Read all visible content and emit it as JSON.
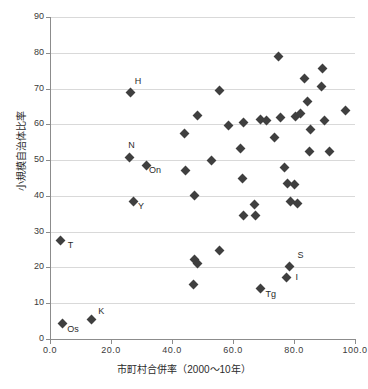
{
  "chart_data": {
    "type": "scatter",
    "title": "",
    "xlabel": "市町村合併率（2000〜10年）",
    "ylabel": "小規模自治体比率",
    "xlim": [
      0,
      100
    ],
    "ylim": [
      0,
      90
    ],
    "xticks": [
      "0.0",
      "20.0",
      "40.0",
      "60.0",
      "80.0",
      "100.0"
    ],
    "xtick_values": [
      0,
      20,
      40,
      60,
      80,
      100
    ],
    "yticks": [
      "0",
      "10",
      "20",
      "30",
      "40",
      "50",
      "60",
      "70",
      "80",
      "90"
    ],
    "ytick_values": [
      0,
      10,
      20,
      30,
      40,
      50,
      60,
      70,
      80,
      90
    ],
    "grid": "horizontal",
    "legend": "none",
    "marker": "diamond",
    "marker_color": "#3f3f3f",
    "grid_color": "#d9d9d9",
    "axis_color": "#8c8c8c",
    "points": [
      {
        "x": 4.0,
        "y": 4.3,
        "label": "Os",
        "label_dx": 5,
        "label_dy": 5
      },
      {
        "x": 13.5,
        "y": 5.4,
        "label": "K",
        "label_dx": 7,
        "label_dy": -9
      },
      {
        "x": 3.5,
        "y": 27.4,
        "label": "T",
        "label_dx": 7,
        "label_dy": 4
      },
      {
        "x": 26.5,
        "y": 69.0,
        "label": "H",
        "label_dx": 4,
        "label_dy": -11
      },
      {
        "x": 26.0,
        "y": 50.8,
        "label": "N",
        "label_dx": -1,
        "label_dy": -12
      },
      {
        "x": 31.5,
        "y": 48.6,
        "label": "On",
        "label_dx": 3,
        "label_dy": 5
      },
      {
        "x": 27.5,
        "y": 38.5,
        "label": "Y",
        "label_dx": 4,
        "label_dy": 5
      },
      {
        "x": 78.5,
        "y": 20.4,
        "label": "S",
        "label_dx": 8,
        "label_dy": -11
      },
      {
        "x": 77.5,
        "y": 17.3,
        "label": "I",
        "label_dx": 9,
        "label_dy": 0
      },
      {
        "x": 69.0,
        "y": 14.0,
        "label": "Tg",
        "label_dx": 5,
        "label_dy": 5
      },
      {
        "x": 47.0,
        "y": 15.2,
        "label": "",
        "label_dx": 0,
        "label_dy": 0
      },
      {
        "x": 47.5,
        "y": 22.3,
        "label": "",
        "label_dx": 0,
        "label_dy": 0
      },
      {
        "x": 48.5,
        "y": 21.2,
        "label": "",
        "label_dx": 0,
        "label_dy": 0
      },
      {
        "x": 55.5,
        "y": 24.6,
        "label": "",
        "label_dx": 0,
        "label_dy": 0
      },
      {
        "x": 47.5,
        "y": 40.2,
        "label": "",
        "label_dx": 0,
        "label_dy": 0
      },
      {
        "x": 44.5,
        "y": 47.0,
        "label": "",
        "label_dx": 0,
        "label_dy": 0
      },
      {
        "x": 44.0,
        "y": 57.3,
        "label": "",
        "label_dx": 0,
        "label_dy": 0
      },
      {
        "x": 48.5,
        "y": 62.6,
        "label": "",
        "label_dx": 0,
        "label_dy": 0
      },
      {
        "x": 55.5,
        "y": 69.5,
        "label": "",
        "label_dx": 0,
        "label_dy": 0
      },
      {
        "x": 53.0,
        "y": 50.0,
        "label": "",
        "label_dx": 0,
        "label_dy": 0
      },
      {
        "x": 58.5,
        "y": 59.7,
        "label": "",
        "label_dx": 0,
        "label_dy": 0
      },
      {
        "x": 63.5,
        "y": 60.4,
        "label": "",
        "label_dx": 0,
        "label_dy": 0
      },
      {
        "x": 62.5,
        "y": 53.3,
        "label": "",
        "label_dx": 0,
        "label_dy": 0
      },
      {
        "x": 63.0,
        "y": 44.8,
        "label": "",
        "label_dx": 0,
        "label_dy": 0
      },
      {
        "x": 67.0,
        "y": 37.6,
        "label": "",
        "label_dx": 0,
        "label_dy": 0
      },
      {
        "x": 63.5,
        "y": 34.4,
        "label": "",
        "label_dx": 0,
        "label_dy": 0
      },
      {
        "x": 67.5,
        "y": 34.4,
        "label": "",
        "label_dx": 0,
        "label_dy": 0
      },
      {
        "x": 69.0,
        "y": 61.3,
        "label": "",
        "label_dx": 0,
        "label_dy": 0
      },
      {
        "x": 71.0,
        "y": 61.2,
        "label": "",
        "label_dx": 0,
        "label_dy": 0
      },
      {
        "x": 73.5,
        "y": 56.4,
        "label": "",
        "label_dx": 0,
        "label_dy": 0
      },
      {
        "x": 75.0,
        "y": 79.0,
        "label": "",
        "label_dx": 0,
        "label_dy": 0
      },
      {
        "x": 75.5,
        "y": 61.8,
        "label": "",
        "label_dx": 0,
        "label_dy": 0
      },
      {
        "x": 77.0,
        "y": 47.8,
        "label": "",
        "label_dx": 0,
        "label_dy": 0
      },
      {
        "x": 78.0,
        "y": 43.5,
        "label": "",
        "label_dx": 0,
        "label_dy": 0
      },
      {
        "x": 80.0,
        "y": 43.3,
        "label": "",
        "label_dx": 0,
        "label_dy": 0
      },
      {
        "x": 79.0,
        "y": 38.5,
        "label": "",
        "label_dx": 0,
        "label_dy": 0
      },
      {
        "x": 81.0,
        "y": 38.0,
        "label": "",
        "label_dx": 0,
        "label_dy": 0
      },
      {
        "x": 80.5,
        "y": 62.2,
        "label": "",
        "label_dx": 0,
        "label_dy": 0
      },
      {
        "x": 82.0,
        "y": 63.0,
        "label": "",
        "label_dx": 0,
        "label_dy": 0
      },
      {
        "x": 83.5,
        "y": 72.8,
        "label": "",
        "label_dx": 0,
        "label_dy": 0
      },
      {
        "x": 84.5,
        "y": 66.5,
        "label": "",
        "label_dx": 0,
        "label_dy": 0
      },
      {
        "x": 85.5,
        "y": 58.6,
        "label": "",
        "label_dx": 0,
        "label_dy": 0
      },
      {
        "x": 85.0,
        "y": 52.3,
        "label": "",
        "label_dx": 0,
        "label_dy": 0
      },
      {
        "x": 89.5,
        "y": 75.6,
        "label": "",
        "label_dx": 0,
        "label_dy": 0
      },
      {
        "x": 89.0,
        "y": 70.5,
        "label": "",
        "label_dx": 0,
        "label_dy": 0
      },
      {
        "x": 90.0,
        "y": 61.0,
        "label": "",
        "label_dx": 0,
        "label_dy": 0
      },
      {
        "x": 91.5,
        "y": 52.4,
        "label": "",
        "label_dx": 0,
        "label_dy": 0
      },
      {
        "x": 97.0,
        "y": 64.0,
        "label": "",
        "label_dx": 0,
        "label_dy": 0
      }
    ]
  }
}
